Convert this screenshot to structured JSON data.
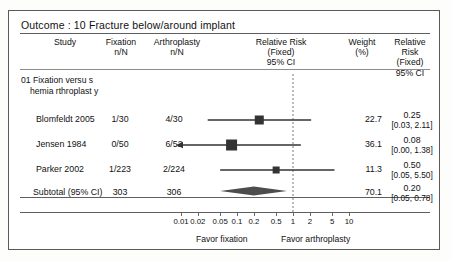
{
  "outcome": {
    "label": "Outcome : 10 Fracture below/around implant"
  },
  "columns": {
    "study": "Study",
    "fixation": "Fixation\nn/N",
    "fixation_l1": "Fixation",
    "fixation_l2": "n/N",
    "arthroplasty_l1": "Arthroplasty",
    "arthroplasty_l2": "n/N",
    "rr_l1": "Relative Risk",
    "rr_l2": "(Fixed)",
    "rr_l3": "95% CI",
    "weight_l1": "Weight",
    "weight_l2": "(%)",
    "rr2_l1": "Relative",
    "rr2_l2": "Risk",
    "rr2_l3": "(Fixed)",
    "rr2_l4": "95% CI"
  },
  "subgroup": {
    "line1": "01 Fixation versu s",
    "line2": "hemia rthroplast y"
  },
  "rows": [
    {
      "study": "Blomfeldt 2005",
      "fixation": "1/30",
      "arthroplasty": "4/30",
      "weight": "22.7",
      "estimate": "0.25",
      "ci": "[0.03,  2.11]",
      "rr": 0.25,
      "lower": 0.03,
      "upper": 2.11,
      "marker": "square"
    },
    {
      "study": "Jensen 1984",
      "fixation": "0/50",
      "arthroplasty": "6/52",
      "weight": "36.1",
      "estimate": "0.08",
      "ci": "[0.00,  1.38]",
      "rr": 0.08,
      "lower": 0.0,
      "upper": 1.38,
      "marker": "square",
      "left_arrow": true
    },
    {
      "study": "Parker 2002",
      "fixation": "1/223",
      "arthroplasty": "2/224",
      "weight": "11.3",
      "estimate": "0.50",
      "ci": "[0.05,  5.50]",
      "rr": 0.5,
      "lower": 0.05,
      "upper": 5.5,
      "marker": "square"
    }
  ],
  "subtotal": {
    "label": "Subtotal  (95% CI)",
    "fixation": "303",
    "arthroplasty": "306",
    "weight": "70.1",
    "estimate": "0.20",
    "ci": "[0.05,  0.78]",
    "rr": 0.2,
    "lower": 0.05,
    "upper": 0.78,
    "marker": "diamond"
  },
  "axis": {
    "ticks": [
      "0.01",
      "0.02",
      "0.05",
      "0.1",
      "0.2",
      "0.5",
      "1",
      "2",
      "5",
      "10"
    ],
    "tick_values": [
      0.01,
      0.02,
      0.05,
      0.1,
      0.2,
      0.5,
      1,
      2,
      5,
      10
    ],
    "scale": "log",
    "null_value": 1,
    "favor_left": "Favor fixation",
    "favor_right": "Favor arthroplasty"
  },
  "chart_data": {
    "type": "forest",
    "title": "Outcome : 10 Fracture below/around implant",
    "xlabel": "Relative Risk (Fixed) 95% CI",
    "scale": "log",
    "xlim": [
      0.01,
      10
    ],
    "null_line": 1,
    "studies": [
      {
        "name": "Blomfeldt 2005",
        "events_fixation": 1,
        "total_fixation": 30,
        "events_arthroplasty": 4,
        "total_arthroplasty": 30,
        "weight_pct": 22.7,
        "rr": 0.25,
        "ci_low": 0.03,
        "ci_high": 2.11
      },
      {
        "name": "Jensen 1984",
        "events_fixation": 0,
        "total_fixation": 50,
        "events_arthroplasty": 6,
        "total_arthroplasty": 52,
        "weight_pct": 36.1,
        "rr": 0.08,
        "ci_low": 0.0,
        "ci_high": 1.38
      },
      {
        "name": "Parker 2002",
        "events_fixation": 1,
        "total_fixation": 223,
        "events_arthroplasty": 2,
        "total_arthroplasty": 224,
        "weight_pct": 11.3,
        "rr": 0.5,
        "ci_low": 0.05,
        "ci_high": 5.5
      }
    ],
    "pooled": {
      "name": "Subtotal (95% CI)",
      "total_fixation": 303,
      "total_arthroplasty": 306,
      "weight_pct": 70.1,
      "rr": 0.2,
      "ci_low": 0.05,
      "ci_high": 0.78
    },
    "ticks": [
      0.01,
      0.02,
      0.05,
      0.1,
      0.2,
      0.5,
      1,
      2,
      5,
      10
    ],
    "annotations": [
      "Favor fixation",
      "Favor arthroplasty"
    ],
    "colors": {
      "marker": "#333333",
      "line": "#333333",
      "diamond": "#555555",
      "null_line": "#777777"
    }
  }
}
